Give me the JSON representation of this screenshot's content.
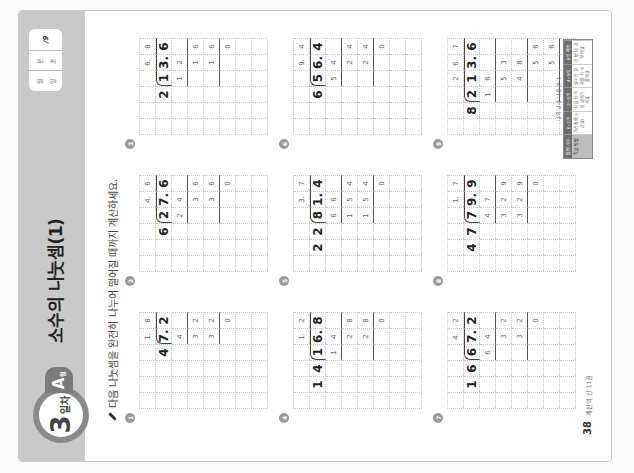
{
  "header": {
    "day_number": "3",
    "day_suffix": "일차",
    "set_letter": "A",
    "set_suffix": "형",
    "title": "소수의 나눗셈(1)",
    "score_box": {
      "date_labels": [
        "월",
        "일"
      ],
      "time_labels": [
        "분",
        "초"
      ],
      "score_max": "/9"
    }
  },
  "instruction": "다음 나눗셈을 완전히 나누어 떨어질 때까지 계산하세요.",
  "problems": [
    {
      "num": "1",
      "dividend": "7.2",
      "divisor": "4",
      "quotient": "1.8",
      "work": [
        "4",
        "32",
        "32",
        "0"
      ]
    },
    {
      "num": "2",
      "dividend": "27.6",
      "divisor": "6",
      "quotient": "4.6",
      "work": [
        "24",
        "36",
        "36",
        "0"
      ]
    },
    {
      "num": "3",
      "dividend": "13.6",
      "divisor": "2",
      "quotient": "6.8",
      "work": [
        "12",
        "16",
        "16",
        "0"
      ]
    },
    {
      "num": "4",
      "dividend": "16.8",
      "divisor": "14",
      "quotient": "1.2",
      "work": [
        "14",
        "28",
        "28",
        "0"
      ]
    },
    {
      "num": "5",
      "dividend": "81.4",
      "divisor": "22",
      "quotient": "3.7",
      "work": [
        "66",
        "154",
        "154",
        "0"
      ]
    },
    {
      "num": "6",
      "dividend": "56.4",
      "divisor": "6",
      "quotient": "9.4",
      "work": [
        "54",
        "24",
        "24",
        "0"
      ]
    },
    {
      "num": "7",
      "dividend": "67.2",
      "divisor": "16",
      "quotient": "4.2",
      "work": [
        "64",
        "32",
        "32",
        "0"
      ]
    },
    {
      "num": "8",
      "dividend": "79.9",
      "divisor": "47",
      "quotient": "1.7",
      "work": [
        "47",
        "329",
        "329",
        "0"
      ]
    },
    {
      "num": "9",
      "dividend": "213.6",
      "divisor": "8",
      "quotient": "26.7",
      "work": [
        "16",
        "53",
        "48",
        "56",
        "56",
        "0"
      ]
    }
  ],
  "grid": {
    "p1": [
      [
        "",
        "",
        "",
        "1.",
        "8",
        ""
      ],
      [
        "",
        "4",
        ")7.",
        "2",
        "",
        ""
      ],
      [
        "",
        "",
        "4",
        "",
        "",
        ""
      ],
      [
        "",
        "",
        "3",
        "2",
        "",
        ""
      ],
      [
        "",
        "",
        "3",
        "2",
        "",
        ""
      ],
      [
        "",
        "",
        "",
        "0",
        "",
        ""
      ],
      [
        "",
        "",
        "",
        "",
        "",
        ""
      ],
      [
        "",
        "",
        "",
        "",
        "",
        ""
      ]
    ]
  },
  "footer": {
    "page_number": "38",
    "book_title": "계산의 신 11권",
    "eval_caption": "나의 날과 나를 한다",
    "eval_headers": [
      "틀린 개수",
      "0~1개",
      "2~3개",
      "4~5개",
      "6개 이상"
    ],
    "eval_cells": [
      "학습 방법",
      "계산왕이시군요!",
      "다음 단계로 넘어가세요",
      "실수한 문제를 다시 풀어요",
      "한 번 더 공부해요"
    ]
  }
}
